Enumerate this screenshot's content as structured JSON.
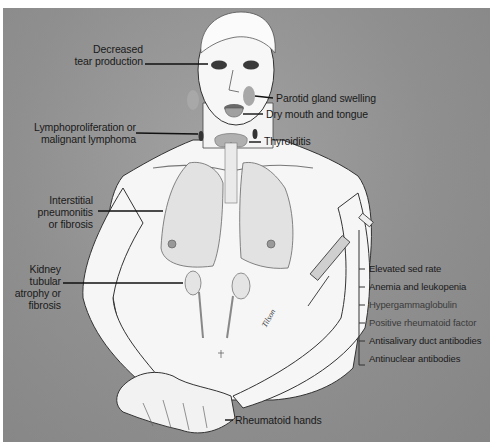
{
  "figure": {
    "colors": {
      "background": "#8f8f8f",
      "border": "#ffffff",
      "skin": "#f6f6f6",
      "outline": "#2a2a2a",
      "text": "#1a1a1a"
    }
  },
  "labels": {
    "left": [
      {
        "id": "tear",
        "line1": "Decreased",
        "line2": "tear production"
      },
      {
        "id": "lympho",
        "line1": "Lymphoproliferation or",
        "line2": "malignant lymphoma"
      },
      {
        "id": "lung",
        "line1": "Interstitial",
        "line2": "pneumonitis",
        "line3": "or fibrosis"
      },
      {
        "id": "kidney",
        "line1": "Kidney",
        "line2": "tubular",
        "line3": "atrophy or",
        "line4": "fibrosis"
      }
    ],
    "right": [
      {
        "id": "parotid",
        "text": "Parotid gland swelling"
      },
      {
        "id": "mouth",
        "text": "Dry mouth and tongue"
      },
      {
        "id": "thyroid",
        "text": "Thyroiditis"
      }
    ],
    "bottom": [
      {
        "id": "hands",
        "text": "Rheumatoid hands"
      }
    ]
  },
  "lab_findings": {
    "items": [
      "Elevated sed rate",
      "Anemia and leukopenia",
      "Hypergammaglobulin",
      "Positive rheumatoid factor",
      "Antisalivary duct antibodies",
      "Antinuclear antibodies"
    ]
  },
  "icons": {
    "syringe": "syringe-icon",
    "signature": "artist-signature"
  },
  "signature_text": "Tilson"
}
